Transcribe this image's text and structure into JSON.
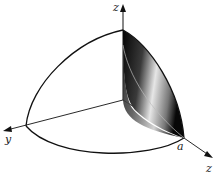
{
  "figure": {
    "labels": {
      "z_axis": "z",
      "y_axis": "y",
      "a_point": "a",
      "x_axis": "z"
    },
    "colors": {
      "line": "#111111",
      "shade_dark": "#0a0a0a",
      "shade_light": "#d8d8d8",
      "background": "#ffffff"
    }
  }
}
